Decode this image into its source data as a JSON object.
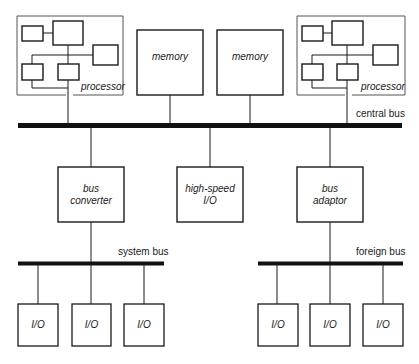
{
  "diagram": {
    "type": "block-diagram",
    "processors": [
      {
        "label": "processor"
      },
      {
        "label": "processor"
      }
    ],
    "memories": [
      {
        "label": "memory"
      },
      {
        "label": "memory"
      }
    ],
    "central_bus": {
      "label": "central bus"
    },
    "bridges": [
      {
        "label_line1": "bus",
        "label_line2": "converter"
      },
      {
        "label_line1": "high-speed",
        "label_line2": "I/O"
      },
      {
        "label_line1": "bus",
        "label_line2": "adaptor"
      }
    ],
    "system_bus": {
      "label": "system bus"
    },
    "foreign_bus": {
      "label": "foreign bus"
    },
    "io_devices": [
      {
        "label": "I/O"
      },
      {
        "label": "I/O"
      },
      {
        "label": "I/O"
      },
      {
        "label": "I/O"
      },
      {
        "label": "I/O"
      },
      {
        "label": "I/O"
      }
    ],
    "colors": {
      "stroke": "#1a1a1a",
      "outline": "#555555",
      "background": "#ffffff"
    }
  }
}
